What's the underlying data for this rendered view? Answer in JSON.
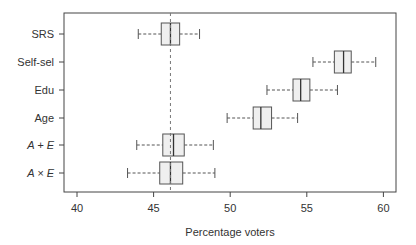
{
  "chart_data": {
    "type": "boxplot",
    "title": "",
    "xlabel": "Percentage voters",
    "ylabel": "",
    "xlim": [
      39.2,
      61
    ],
    "xticks": [
      40,
      45,
      50,
      55,
      60
    ],
    "categories": [
      "SRS",
      "Self-sel",
      "Edu",
      "Age",
      "A + E",
      "A × E"
    ],
    "category_italic": [
      false,
      false,
      false,
      false,
      true,
      true
    ],
    "reference_line": 46.1,
    "boxes": [
      {
        "label": "SRS",
        "whisker_low": 44.0,
        "q1": 45.5,
        "median": 46.1,
        "q3": 46.7,
        "whisker_high": 48.0
      },
      {
        "label": "Self-sel",
        "whisker_low": 55.4,
        "q1": 56.8,
        "median": 57.4,
        "q3": 57.9,
        "whisker_high": 59.5
      },
      {
        "label": "Edu",
        "whisker_low": 52.4,
        "q1": 54.1,
        "median": 54.6,
        "q3": 55.2,
        "whisker_high": 57.0
      },
      {
        "label": "Age",
        "whisker_low": 49.8,
        "q1": 51.5,
        "median": 52.0,
        "q3": 52.7,
        "whisker_high": 54.4
      },
      {
        "label": "A + E",
        "whisker_low": 43.9,
        "q1": 45.6,
        "median": 46.3,
        "q3": 47.0,
        "whisker_high": 48.9
      },
      {
        "label": "A × E",
        "whisker_low": 43.3,
        "q1": 45.4,
        "median": 46.1,
        "q3": 46.9,
        "whisker_high": 49.0
      }
    ],
    "grid": false,
    "legend": null
  },
  "colors": {
    "box_fill": "#efefef",
    "stroke": "#555555",
    "axis": "#444444",
    "text": "#333333"
  }
}
